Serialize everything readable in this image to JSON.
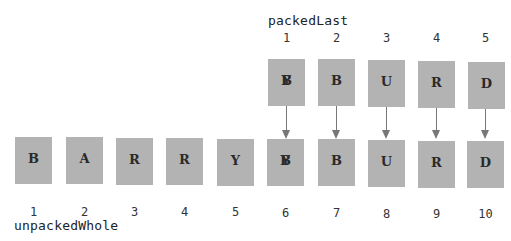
{
  "packed": {
    "label": "packedLast",
    "cells": [
      {
        "index": "1",
        "char": "B",
        "overstrike": "Y"
      },
      {
        "index": "2",
        "char": "B"
      },
      {
        "index": "3",
        "char": "U"
      },
      {
        "index": "4",
        "char": "R"
      },
      {
        "index": "5",
        "char": "D"
      }
    ]
  },
  "unpacked": {
    "label": "unpackedWhole",
    "cells": [
      {
        "index": "1",
        "char": "B"
      },
      {
        "index": "2",
        "char": "A"
      },
      {
        "index": "3",
        "char": "R"
      },
      {
        "index": "4",
        "char": "R"
      },
      {
        "index": "5",
        "char": "Y"
      },
      {
        "index": "6",
        "char": "B",
        "overstrike": "Y"
      },
      {
        "index": "7",
        "char": "B"
      },
      {
        "index": "8",
        "char": "U"
      },
      {
        "index": "9",
        "char": "R"
      },
      {
        "index": "10",
        "char": "D"
      }
    ]
  },
  "colors": {
    "cell_fill": "#b3b3b3",
    "arrow": "#777777",
    "background": "#ffffff"
  }
}
